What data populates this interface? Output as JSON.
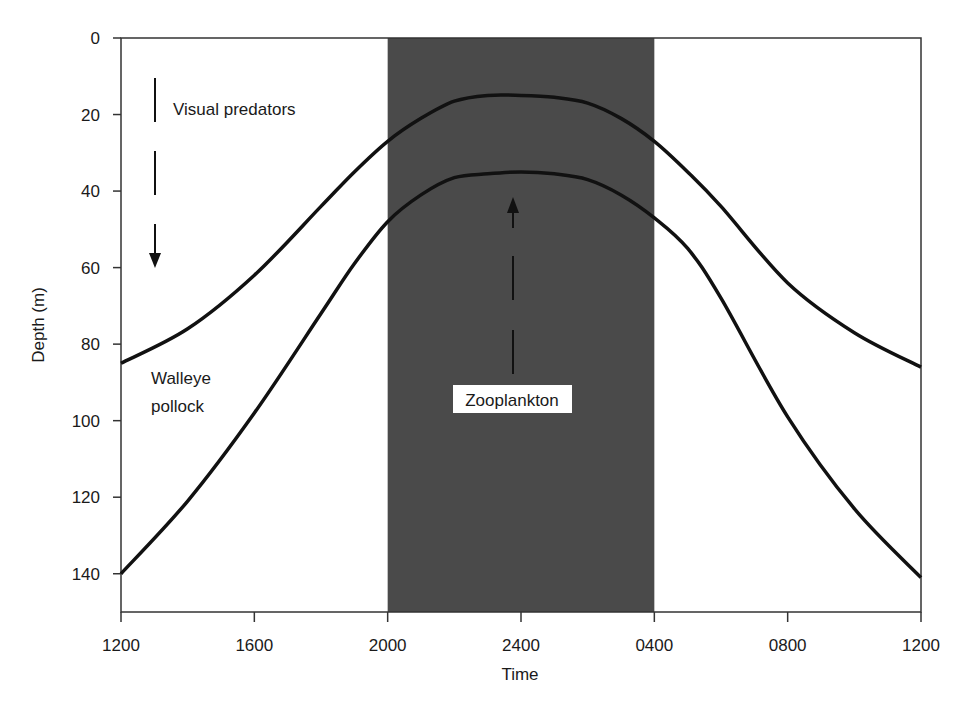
{
  "chart_data": {
    "type": "line",
    "title": "",
    "xlabel": "Time",
    "ylabel": "Depth (m)",
    "x_tick_labels": [
      "1200",
      "1600",
      "2000",
      "2400",
      "0400",
      "0800",
      "1200"
    ],
    "y_tick_labels": [
      "0",
      "20",
      "40",
      "60",
      "80",
      "100",
      "120",
      "140"
    ],
    "ylim": [
      0,
      150
    ],
    "y_inverted": true,
    "x_hours_range": [
      0,
      24
    ],
    "grid": false,
    "shaded_region": {
      "label": "night",
      "from": "2000",
      "to": "0400",
      "from_hour": 8,
      "to_hour": 16,
      "color": "#4a4a4a"
    },
    "x_hours": [
      0,
      2,
      4,
      6,
      7,
      8,
      9,
      10,
      11,
      12,
      13,
      14,
      15,
      16,
      17,
      18,
      20,
      22,
      24
    ],
    "series": [
      {
        "name": "Upper curve (visual predators boundary)",
        "values": [
          85,
          76,
          62,
          44,
          35,
          27,
          21,
          16.5,
          15,
          15,
          15.5,
          17,
          21,
          27,
          35,
          44,
          64,
          77,
          86
        ]
      },
      {
        "name": "Lower curve (walleye pollock / zooplankton boundary)",
        "values": [
          140,
          121,
          98,
          72,
          59,
          48,
          41,
          36.5,
          35.5,
          35,
          35.5,
          37,
          41,
          47,
          55,
          68,
          99,
          123,
          141
        ]
      }
    ],
    "annotations": [
      {
        "text": "Visual predators",
        "arrow": "down (dashed)"
      },
      {
        "text": "Walleye pollock"
      },
      {
        "text": "Zooplankton",
        "arrow": "up (dashed)",
        "boxed": true
      }
    ]
  },
  "labels": {
    "visual_predators": "Visual predators",
    "walleye": "Walleye",
    "pollock": "pollock",
    "zooplankton": "Zooplankton"
  },
  "colors": {
    "night_shade": "#4a4a4a",
    "line": "#111111",
    "axis": "#333333"
  }
}
